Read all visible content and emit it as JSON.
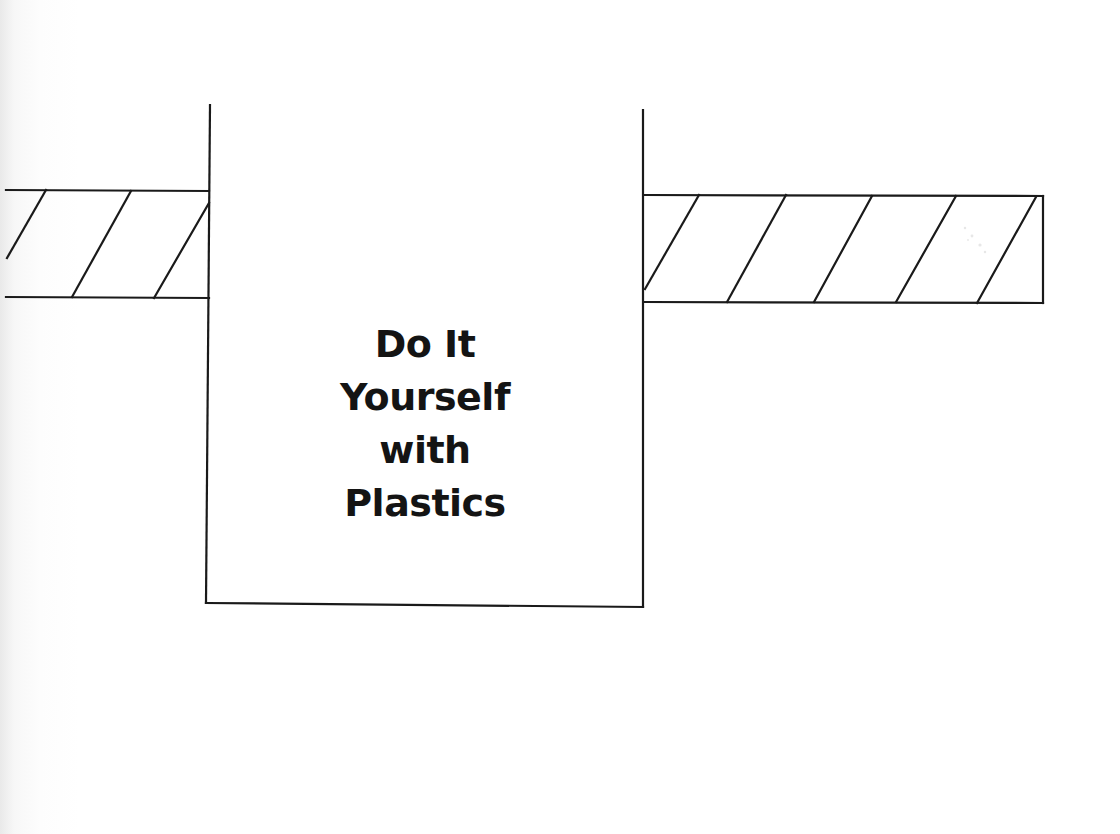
{
  "page": {
    "title_lines": [
      "Do It",
      "Yourself",
      "with",
      "Plastics"
    ]
  },
  "drawing": {
    "stroke_color": "#1a1a1a",
    "label_box": {
      "left": 207,
      "top": 105,
      "right": 644,
      "bottom": 605
    },
    "left_bar": {
      "left": 0,
      "top": 190,
      "right": 209,
      "bottom": 298
    },
    "right_bar": {
      "left": 645,
      "top": 195,
      "right": 1043,
      "bottom": 303
    }
  }
}
